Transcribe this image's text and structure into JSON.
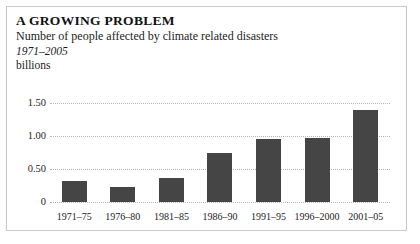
{
  "heading": {
    "title": "A GROWING PROBLEM",
    "subtitle": "Number of people affected by climate related disasters",
    "period": "1971–2005",
    "units": "billions"
  },
  "colors": {
    "bar": "#454545",
    "gridline": "#b5b5b5",
    "frame": "#c9c9c9",
    "background": "#ffffff",
    "text": "#1d1d1d"
  },
  "chart_data": {
    "type": "bar",
    "title": "A GROWING PROBLEM",
    "subtitle": "Number of people affected by climate related disasters",
    "period": "1971–2005",
    "xlabel": "",
    "ylabel": "billions",
    "ylim": [
      0,
      1.5
    ],
    "yticks": [
      0,
      0.5,
      1.0,
      1.5
    ],
    "ytick_labels": [
      "0",
      "0.50",
      "1.00",
      "1.50"
    ],
    "grid": true,
    "legend": "none",
    "categories": [
      "1971–75",
      "1976–80",
      "1981–85",
      "1986–90",
      "1991–95",
      "1996–2000",
      "2001–05"
    ],
    "values": [
      0.32,
      0.23,
      0.36,
      0.74,
      0.96,
      0.97,
      1.39
    ]
  }
}
